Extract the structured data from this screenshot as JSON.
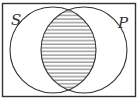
{
  "diagram": {
    "type": "venn",
    "sets": [
      {
        "name": "S",
        "label": "S"
      },
      {
        "name": "P",
        "label": "P"
      }
    ],
    "shaded_region": "S ∩ P",
    "shading_style": "horizontal-hatch",
    "colors": {
      "stroke": "#333333",
      "background": "#ffffff"
    }
  }
}
